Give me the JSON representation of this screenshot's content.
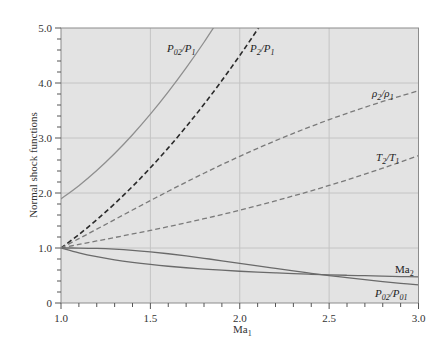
{
  "chart_data": {
    "type": "line",
    "title": "",
    "xlabel": "Ma1",
    "ylabel": "Normal shock functions",
    "xlim": [
      1.0,
      3.0
    ],
    "ylim": [
      0,
      5.0
    ],
    "grid": true,
    "legend_position": "inline labels",
    "x_ticks": [
      "1.0",
      "1.5",
      "2.0",
      "2.5",
      "3.0"
    ],
    "y_ticks": [
      "0",
      "1.0",
      "2.0",
      "3.0",
      "4.0",
      "5.0"
    ],
    "x": [
      1.0,
      1.1,
      1.2,
      1.3,
      1.4,
      1.5,
      1.6,
      1.7,
      1.8,
      1.9,
      2.0,
      2.1,
      2.2,
      2.3,
      2.4,
      2.5,
      2.6,
      2.7,
      2.8,
      2.9,
      3.0
    ],
    "series": [
      {
        "name": "P02/P1",
        "style": "solid",
        "color": "#8f8f8f",
        "values": [
          1.893,
          2.133,
          2.408,
          2.717,
          3.059,
          3.433,
          3.838,
          4.274,
          4.741,
          5.24,
          null,
          null,
          null,
          null,
          null,
          null,
          null,
          null,
          null,
          null,
          null
        ]
      },
      {
        "name": "P2/P1",
        "style": "dashed",
        "color": "#2a2a2a",
        "values": [
          1.0,
          1.245,
          1.513,
          1.805,
          2.12,
          2.458,
          2.82,
          3.205,
          3.613,
          4.045,
          4.5,
          4.978,
          5.48,
          null,
          null,
          null,
          null,
          null,
          null,
          null,
          null
        ]
      },
      {
        "name": "ρ2/ρ1",
        "style": "dashed",
        "color": "#7a7a7a",
        "values": [
          1.0,
          1.169,
          1.342,
          1.516,
          1.69,
          1.862,
          2.032,
          2.198,
          2.359,
          2.516,
          2.667,
          2.812,
          2.951,
          3.085,
          3.212,
          3.333,
          3.449,
          3.559,
          3.664,
          3.763,
          3.857
        ]
      },
      {
        "name": "T2/T1",
        "style": "dashed",
        "color": "#7a7a7a",
        "values": [
          1.0,
          1.065,
          1.128,
          1.191,
          1.255,
          1.32,
          1.388,
          1.458,
          1.532,
          1.608,
          1.687,
          1.77,
          1.857,
          1.947,
          2.04,
          2.137,
          2.238,
          2.343,
          2.451,
          2.563,
          2.679
        ]
      },
      {
        "name": "Ma2",
        "style": "solid",
        "color": "#6a6a6a",
        "values": [
          1.0,
          0.912,
          0.842,
          0.786,
          0.74,
          0.701,
          0.668,
          0.641,
          0.617,
          0.596,
          0.577,
          0.561,
          0.547,
          0.534,
          0.522,
          0.513,
          0.504,
          0.496,
          0.488,
          0.481,
          0.475
        ]
      },
      {
        "name": "P02/P01",
        "style": "solid",
        "color": "#6a6a6a",
        "values": [
          1.0,
          0.9989,
          0.9928,
          0.9794,
          0.9582,
          0.9298,
          0.8952,
          0.8557,
          0.8127,
          0.7674,
          0.7209,
          0.6742,
          0.6281,
          0.5833,
          0.5401,
          0.499,
          0.4601,
          0.4236,
          0.3895,
          0.3577,
          0.3283
        ]
      }
    ]
  },
  "labels": {
    "ylabel": "Normal shock functions",
    "xlabel_main": "Ma",
    "xlabel_sub": "1",
    "p02_p1": {
      "a": "P",
      "a_sub": "02",
      "b": "/P",
      "b_sub": "1"
    },
    "p2_p1": {
      "a": "P",
      "a_sub": "2",
      "b": "/P",
      "b_sub": "1"
    },
    "rho2_rho1": {
      "a": "ρ",
      "a_sub": "2",
      "b": "/ρ",
      "b_sub": "1"
    },
    "t2_t1": {
      "a": "T",
      "a_sub": "2",
      "b": "/T",
      "b_sub": "1"
    },
    "ma2": {
      "a": "Ma",
      "a_sub": "2"
    },
    "p02_p01": {
      "a": "P",
      "a_sub": "02",
      "b": "/P",
      "b_sub": "01"
    }
  },
  "colors": {
    "plot_bg": "#e3e3e3",
    "grid": "#c4c4c4",
    "frame": "#8c8c8c"
  }
}
